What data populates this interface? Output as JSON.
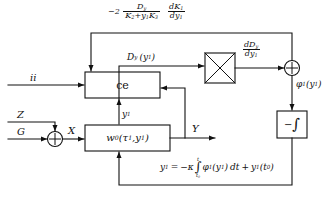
{
  "diagram": {
    "stroke_color": "#111111",
    "background_color": "#ffffff"
  },
  "top_formula": {
    "lead": "−2",
    "frac1_num": "D",
    "frac1_num_sub": "y",
    "frac1_den_a": "K",
    "frac1_den_a_sub": "2",
    "frac1_den_plus": "+",
    "frac1_den_b": "y",
    "frac1_den_b_sub": "1",
    "frac1_den_c": "K",
    "frac1_den_c_sub": "3",
    "frac2_num": "dK",
    "frac2_num_sub": "1",
    "frac2_den": "dy",
    "frac2_den_sub": "1"
  },
  "signals": {
    "dy_label": "D",
    "dy_label_sub": "y",
    "dy_arg": "(y",
    "dy_arg_sub": "1",
    "dy_arg_close": ")",
    "ddy_num": "dD",
    "ddy_num_sub": "y",
    "ddy_den": "dy",
    "ddy_den_sub": "1",
    "phi": "φ",
    "phi_sub": "1",
    "phi_arg": "(y",
    "phi_arg_sub": "1",
    "phi_arg_close": ")",
    "input_u": "ii",
    "input_z": "Z",
    "input_g": "G",
    "node_x": "X",
    "output_y": "Y",
    "feedback_y1": "y",
    "feedback_y1_sub": "1"
  },
  "blocks": {
    "ce": {
      "label": "ce",
      "name": "controller-block"
    },
    "multiplier": {
      "label": "×",
      "name": "multiplier-block"
    },
    "integrator": {
      "minus": "−",
      "symbol": "∫",
      "name": "negative-integrator-block"
    },
    "w0": {
      "label_w": "w",
      "label_sub": "0",
      "label_open": "(",
      "tau": "τ",
      "tau_sub": "1",
      "comma": ",",
      "y": "y",
      "y_sub": "1",
      "label_close": ")",
      "name": "plant-transfer-block"
    }
  },
  "summers": {
    "left": {
      "sign": "+",
      "name": "left-summing-junction"
    },
    "right": {
      "sign": "+",
      "name": "right-summing-junction"
    }
  },
  "bottom_formula": {
    "lhs_y": "y",
    "lhs_sub": "1",
    "equals": "=",
    "minus_kappa": "−κ",
    "int_top": "t",
    "int_sym": "∫",
    "int_bot_t": "t",
    "int_bot_sub": "0",
    "phi": "φ",
    "phi_sub": "1",
    "phi_arg": "(y",
    "phi_arg_sub": "1",
    "phi_arg_close": ")",
    "dt": "dt",
    "plus": "+",
    "tail_y": "y",
    "tail_sub": "1",
    "tail_arg_open": "(t",
    "tail_arg_sub": "0",
    "tail_arg_close": ")"
  }
}
